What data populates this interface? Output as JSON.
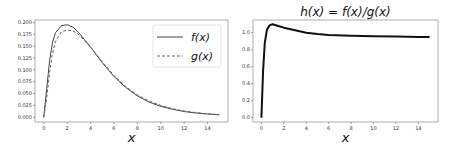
{
  "chart_data": [
    {
      "type": "line",
      "title": "",
      "xlabel": "x",
      "ylabel": "",
      "xlim": [
        -0.75,
        15.75
      ],
      "ylim": [
        -0.01,
        0.205
      ],
      "xticks": [
        0,
        2,
        4,
        6,
        8,
        10,
        12,
        14
      ],
      "yticks": [
        0.0,
        0.025,
        0.05,
        0.075,
        0.1,
        0.125,
        0.15,
        0.175,
        0.2
      ],
      "ytick_labels": [
        "0.000",
        "0.025",
        "0.050",
        "0.075",
        "0.100",
        "0.125",
        "0.150",
        "0.175",
        "0.200"
      ],
      "legend": {
        "position": "upper right",
        "entries": [
          "f(x)",
          "g(x)"
        ]
      },
      "series": [
        {
          "name": "f(x)",
          "style": "solid",
          "color": "#444444",
          "x": [
            0,
            0.25,
            0.5,
            0.75,
            1,
            1.5,
            2,
            2.5,
            3,
            4,
            5,
            6,
            7,
            8,
            9,
            10,
            11,
            12,
            13,
            14,
            15
          ],
          "y": [
            0.0,
            0.06,
            0.12,
            0.158,
            0.178,
            0.193,
            0.195,
            0.19,
            0.178,
            0.148,
            0.115,
            0.086,
            0.063,
            0.045,
            0.032,
            0.023,
            0.017,
            0.012,
            0.009,
            0.007,
            0.005
          ]
        },
        {
          "name": "g(x)",
          "style": "dashed",
          "color": "#666666",
          "x": [
            0,
            0.25,
            0.5,
            0.75,
            1,
            1.5,
            2,
            2.5,
            3,
            4,
            5,
            6,
            7,
            8,
            9,
            10,
            11,
            12,
            13,
            14,
            15
          ],
          "y": [
            0.0,
            0.04,
            0.095,
            0.135,
            0.16,
            0.18,
            0.184,
            0.182,
            0.174,
            0.148,
            0.117,
            0.088,
            0.065,
            0.047,
            0.034,
            0.025,
            0.018,
            0.013,
            0.01,
            0.007,
            0.006
          ]
        }
      ]
    },
    {
      "type": "line",
      "title": "h(x) = f(x)/g(x)",
      "xlabel": "x",
      "ylabel": "",
      "xlim": [
        -0.75,
        15.75
      ],
      "ylim": [
        -0.05,
        1.15
      ],
      "xticks": [
        0,
        2,
        4,
        6,
        8,
        10,
        12,
        14
      ],
      "yticks": [
        0.0,
        0.2,
        0.4,
        0.6,
        0.8,
        1.0
      ],
      "ytick_labels": [
        "0.0",
        "0.2",
        "0.4",
        "0.6",
        "0.8",
        "1.0"
      ],
      "series": [
        {
          "name": "h(x)",
          "style": "solid",
          "color": "#111111",
          "x": [
            0,
            0.15,
            0.3,
            0.5,
            0.75,
            1,
            1.5,
            2,
            3,
            4,
            5,
            6,
            8,
            10,
            12,
            14,
            15
          ],
          "y": [
            0.0,
            0.55,
            0.88,
            1.04,
            1.09,
            1.1,
            1.08,
            1.06,
            1.03,
            1.0,
            0.985,
            0.975,
            0.965,
            0.96,
            0.955,
            0.95,
            0.95
          ]
        }
      ]
    }
  ]
}
